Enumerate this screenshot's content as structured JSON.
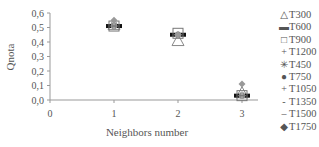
{
  "chart_data": {
    "type": "scatter",
    "title": "",
    "xlabel": "Neighbors number",
    "ylabel": "Qnota",
    "xlim": [
      0,
      3.3
    ],
    "ylim": [
      0,
      0.6
    ],
    "x_ticks": [
      "0",
      "1",
      "2",
      "3"
    ],
    "y_ticks": [
      "0,0",
      "0,1",
      "0,2",
      "0,3",
      "0,4",
      "0,5",
      "0,6"
    ],
    "grid": false,
    "legend_position": "right",
    "x": [
      1,
      2,
      3
    ],
    "series": [
      {
        "name": "T300",
        "marker": "triangle-open",
        "values": [
          0.52,
          0.41,
          0.05
        ]
      },
      {
        "name": "T600",
        "marker": "dash-bold",
        "values": [
          0.51,
          0.45,
          0.03
        ]
      },
      {
        "name": "T900",
        "marker": "square-open",
        "values": [
          0.51,
          0.46,
          0.03
        ]
      },
      {
        "name": "T1200",
        "marker": "plus",
        "values": [
          0.51,
          0.45,
          0.03
        ]
      },
      {
        "name": "T450",
        "marker": "star",
        "values": [
          0.53,
          0.45,
          0.04
        ]
      },
      {
        "name": "T750",
        "marker": "circle-filled",
        "values": [
          0.51,
          0.45,
          0.03
        ]
      },
      {
        "name": "T1050",
        "marker": "plus-light",
        "values": [
          0.51,
          0.45,
          0.03
        ]
      },
      {
        "name": "T1350",
        "marker": "dash",
        "values": [
          0.51,
          0.45,
          0.03
        ]
      },
      {
        "name": "T1500",
        "marker": "dash-long",
        "values": [
          0.51,
          0.45,
          0.03
        ]
      },
      {
        "name": "T1750",
        "marker": "diamond-filled",
        "values": [
          0.55,
          0.45,
          0.11
        ]
      }
    ]
  },
  "legend": {
    "items": [
      {
        "symbol": "△",
        "label": "T300"
      },
      {
        "symbol": "▬",
        "label": "T600"
      },
      {
        "symbol": "□",
        "label": "T900"
      },
      {
        "symbol": "+",
        "label": "T1200"
      },
      {
        "symbol": "✳",
        "label": "T450"
      },
      {
        "symbol": "●",
        "label": "T750"
      },
      {
        "symbol": "+",
        "label": "T1050"
      },
      {
        "symbol": "-",
        "label": "T1350"
      },
      {
        "symbol": "–",
        "label": "T1500"
      },
      {
        "symbol": "◆",
        "label": "T1750"
      }
    ]
  }
}
